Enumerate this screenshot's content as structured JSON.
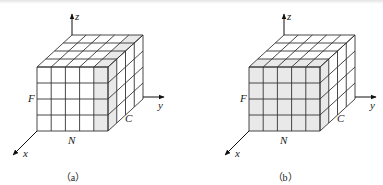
{
  "figures": [
    {
      "id": "a",
      "caption": "（a）",
      "axes": {
        "x": "x",
        "y": "y",
        "z": "z"
      },
      "face_labels": {
        "front": "F",
        "bottom": "N",
        "side": "C"
      },
      "grid": {
        "columns": 5,
        "rows": 4,
        "depth": 4
      },
      "shaded": "last front column slice",
      "origin": [
        37,
        131
      ],
      "shade_color": "#e9e9e9"
    },
    {
      "id": "b",
      "caption": "（b）",
      "axes": {
        "x": "x",
        "y": "y",
        "z": "z"
      },
      "face_labels": {
        "front": "F",
        "bottom": "N",
        "side": "C"
      },
      "grid": {
        "columns": 5,
        "rows": 4,
        "depth": 4
      },
      "shaded": "front face slice",
      "origin": [
        249,
        131
      ],
      "shade_color": "#e9e9e9"
    }
  ],
  "colors": {
    "line": "#333333",
    "shade": "#e9e9e9",
    "background": "#ffffff"
  }
}
